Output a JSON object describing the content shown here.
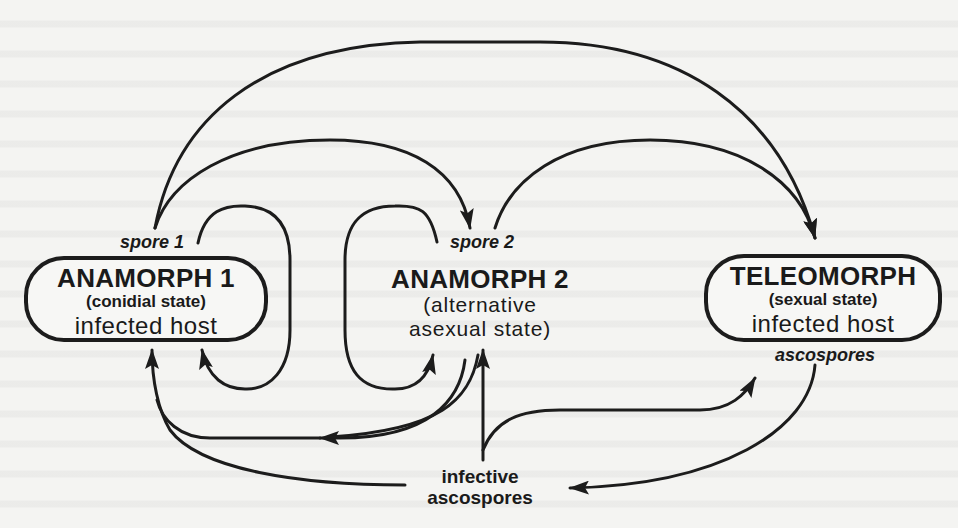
{
  "diagram": {
    "type": "fungal life cycle",
    "nodes": {
      "anamorph1": {
        "title": "ANAMORPH 1",
        "subtitle": "(conidial state)",
        "host": "infected host",
        "spore_label": "spore 1"
      },
      "anamorph2": {
        "title": "ANAMORPH 2",
        "subtitle_line1": "(alternative",
        "subtitle_line2": "asexual state)",
        "spore_label": "spore 2"
      },
      "teleomorph": {
        "title": "TELEOMORPH",
        "subtitle": "(sexual state)",
        "host": "infected host",
        "spore_label": "ascospores"
      },
      "infective": {
        "line1": "infective",
        "line2": "ascospores"
      }
    },
    "edges": [
      {
        "from": "anamorph1 (spore 1)",
        "to": "anamorph2 (spore 2)"
      },
      {
        "from": "anamorph1 (spore 1)",
        "to": "teleomorph"
      },
      {
        "from": "anamorph2 (spore 2)",
        "to": "teleomorph"
      },
      {
        "from": "anamorph2 (spore 2)",
        "to": "anamorph1"
      },
      {
        "from": "anamorph1 (spore 1)",
        "to": "anamorph2"
      },
      {
        "from": "anamorph2",
        "to": "anamorph2 (self loop)"
      },
      {
        "from": "anamorph1",
        "to": "anamorph1 (self loop)"
      },
      {
        "from": "infective ascospores",
        "to": "anamorph1"
      },
      {
        "from": "infective ascospores",
        "to": "anamorph2"
      },
      {
        "from": "infective ascospores",
        "to": "teleomorph"
      },
      {
        "from": "teleomorph (ascospores)",
        "to": "infective ascospores"
      },
      {
        "from": "teleomorph (ascospores)",
        "to": "anamorph1"
      }
    ],
    "colors": {
      "ink": "#1c1c1c",
      "paper": "#f4f4f2"
    }
  }
}
